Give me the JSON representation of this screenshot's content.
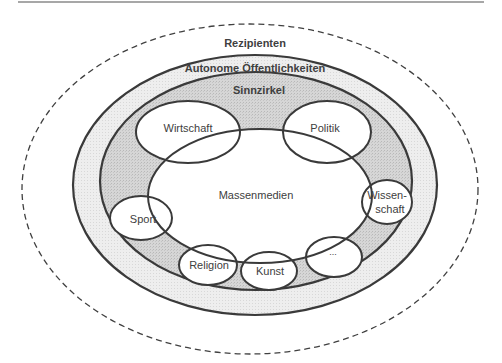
{
  "diagram": {
    "title": "",
    "layers": {
      "outer": {
        "label": "Rezipienten",
        "style": "dashed"
      },
      "autonomous": {
        "label": "Autonome Öffentlichkeiten"
      },
      "meaning_circles": {
        "label": "Sinnzirkel"
      },
      "core": {
        "label": "Massenmedien"
      }
    },
    "subsystems": [
      {
        "label": "Wirtschaft"
      },
      {
        "label": "Politik"
      },
      {
        "label": "Sport"
      },
      {
        "label_line1": "Wissen-",
        "label_line2": "schaft"
      },
      {
        "label": "Religion"
      },
      {
        "label": "Kunst"
      },
      {
        "label": "..."
      }
    ],
    "colors": {
      "stroke": "#3a3a3a",
      "dashed": "#404040",
      "autonomous_fill": "#ededed",
      "sinnzirkel_fill": "#d2d2d2",
      "ellipse_fill": "#ffffff",
      "top_rule": "#8a8a8a"
    }
  }
}
